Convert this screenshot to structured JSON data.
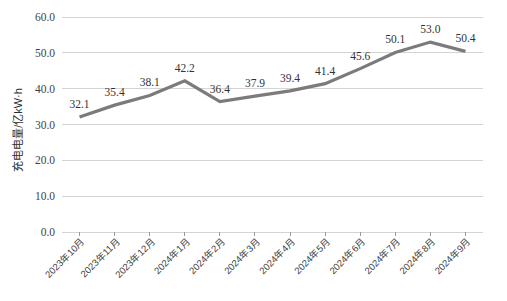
{
  "chart_data": {
    "type": "line",
    "title": "",
    "subtitle": "",
    "xlabel": "",
    "ylabel": "充电电量/亿kW·h",
    "categories": [
      "2023年10月",
      "2023年11月",
      "2023年12月",
      "2024年1月",
      "2024年2月",
      "2024年3月",
      "2024年4月",
      "2024年5月",
      "2024年6月",
      "2024年7月",
      "2024年8月",
      "2024年9月"
    ],
    "values": [
      32.1,
      35.4,
      38.1,
      42.2,
      36.4,
      37.9,
      39.4,
      41.4,
      45.6,
      50.1,
      53.0,
      50.4
    ],
    "data_labels": [
      "32.1",
      "35.4",
      "38.1",
      "42.2",
      "36.4",
      "37.9",
      "39.4",
      "41.4",
      "45.6",
      "50.1",
      "53.0",
      "50.4"
    ],
    "ylim": [
      0.0,
      60.0
    ],
    "ytick_values": [
      0.0,
      10.0,
      20.0,
      30.0,
      40.0,
      50.0,
      60.0
    ],
    "ytick_labels": [
      "0.0",
      "10.0",
      "20.0",
      "30.0",
      "40.0",
      "50.0",
      "60.0"
    ],
    "grid": true,
    "grid_axis": "y",
    "legend": false,
    "legend_position": "none",
    "series": [
      {
        "name": "充电电量",
        "color": "#7b7b7b",
        "values": [
          32.1,
          35.4,
          38.1,
          42.2,
          36.4,
          37.9,
          39.4,
          41.4,
          45.6,
          50.1,
          53.0,
          50.4
        ]
      }
    ],
    "colors": {
      "line": "#7b7b7b",
      "gridline": "#d4d4d4",
      "text": "#3f3f3f",
      "background": "#ffffff"
    }
  }
}
